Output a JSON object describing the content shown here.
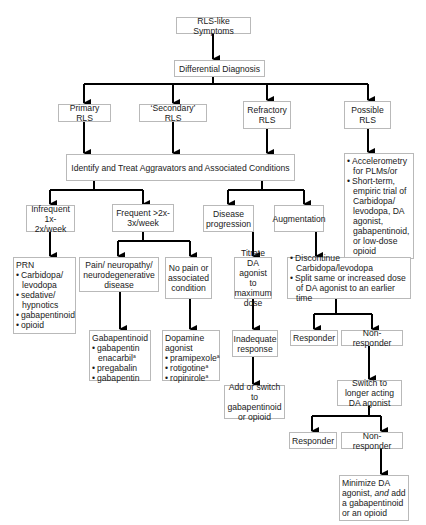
{
  "nodes": {
    "rls_like": "RLS-like Symptoms",
    "differential": "Differential Diagnosis",
    "primary": "Primary RLS",
    "secondary": "‘Secondary’ RLS",
    "refractory": "Refractory RLS",
    "possible": "Possible RLS",
    "identify": "Identify and Treat Aggravators and Associated Conditions",
    "infrequent": "Infrequent 1x-2x/week",
    "frequent": "Frequent >2x-3x/week",
    "disease_progression": "Disease progression",
    "augmentation": "Augmentation",
    "possible_actions": {
      "items": [
        "Accelerometry for PLMs/or",
        "Short-term, empiric trial of Carbidopa/ levodopa, DA agonist, gabapentinoid, or low-dose opioid"
      ]
    },
    "prn": {
      "title": "PRN",
      "items": [
        "Carbidopa/ levodopa",
        "sedative/ hypnotics",
        "gabapentinoid",
        "opioid"
      ]
    },
    "pain": "Pain/ neuropathy/ neurodegenerative disease",
    "no_pain": "No pain or associated condition",
    "titrate": "Titrate DA agonist to maximum dose",
    "discontinue": {
      "items": [
        "Discontinue Carbidopa/levodopa",
        "Split same or increased dose of DA agonist to an earlier time"
      ]
    },
    "gabapentinoid": {
      "title": "Gabapentinoid",
      "items": [
        {
          "text": "gabapentin enacarbil",
          "sup": "a"
        },
        {
          "text": "pregabalin",
          "sup": ""
        },
        {
          "text": "gabapentin",
          "sup": ""
        }
      ]
    },
    "dopamine": {
      "title": "Dopamine agonist",
      "items": [
        {
          "text": "pramipexole",
          "sup": "a"
        },
        {
          "text": "rotigotine",
          "sup": "a"
        },
        {
          "text": "ropinirole",
          "sup": "a"
        }
      ]
    },
    "inadequate": "Inadequate response",
    "responder_1": "Responder",
    "non_responder_1": "Non-responder",
    "add_switch": "Add or switch to gabapentinoid or opioid",
    "switch_longer": "Switch to longer acting DA agonist",
    "responder_2": "Responder",
    "non_responder_2": "Non-responder",
    "minimize": {
      "part1": "Minimize DA agonist, ",
      "emphasis": "and",
      "part2": " add a gabapentinoid or an opioid"
    }
  },
  "colors": {
    "line": "#000000",
    "box_border": "#b9b9b9",
    "text": "#1a1a1a"
  }
}
